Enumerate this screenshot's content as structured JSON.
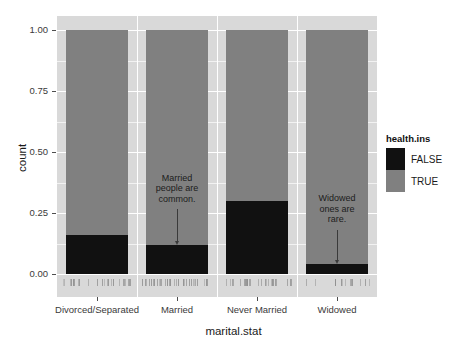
{
  "chart_data": {
    "type": "bar",
    "title": "",
    "xlabel": "marital.stat",
    "ylabel": "count",
    "categories": [
      "Divorced/Separated",
      "Married",
      "Never Married",
      "Widowed"
    ],
    "series": [
      {
        "name": "FALSE",
        "color": "#111111",
        "values": [
          0.16,
          0.12,
          0.3,
          0.04
        ]
      },
      {
        "name": "TRUE",
        "color": "#808080",
        "values": [
          0.84,
          0.88,
          0.7,
          0.96
        ]
      }
    ],
    "stacked": true,
    "ylim": [
      0.0,
      1.0
    ],
    "yticks": [
      "0.00",
      "0.25",
      "0.50",
      "0.75",
      "1.00"
    ],
    "ytick_values": [
      0.0,
      0.25,
      0.5,
      0.75,
      1.0
    ],
    "grid": true,
    "legend": {
      "title": "health.ins",
      "position": "right",
      "entries": [
        {
          "label": "FALSE",
          "color": "#111111"
        },
        {
          "label": "TRUE",
          "color": "#808080"
        }
      ]
    },
    "annotations": [
      {
        "text": "Married\npeople are\ncommon.",
        "category": "Married",
        "arrow": "down"
      },
      {
        "text": "Widowed\nones are\nrare.",
        "category": "Widowed",
        "arrow": "down"
      }
    ],
    "panel_background": "#d9d9d9",
    "plot_background": "#ffffff"
  }
}
